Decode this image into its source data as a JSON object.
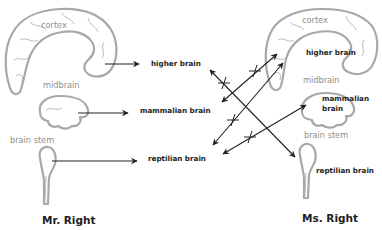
{
  "diagram": {
    "left": {
      "title": "Mr. Right",
      "parts": {
        "cortex": "cortex",
        "midbrain": "midbrain",
        "brain_stem": "brain stem"
      },
      "targets": {
        "higher": "higher brain",
        "mammalian": "mammalian brain",
        "reptilian": "reptilian brain"
      }
    },
    "right": {
      "title": "Ms. Right",
      "parts": {
        "cortex": "cortex",
        "midbrain": "midbrain",
        "brain_stem": "brain stem"
      },
      "labels": {
        "higher": "higher brain",
        "mammalian_line1": "mammalian",
        "mammalian_line2": "brain",
        "reptilian": "reptilian brain"
      }
    },
    "connections": [
      {
        "from": "Mr. Right higher brain",
        "to": "Ms. Right reptilian brain",
        "crossed_out": true
      },
      {
        "from": "Mr. Right mammalian brain",
        "to": "Ms. Right higher brain",
        "crossed_out": true
      },
      {
        "from": "Mr. Right reptilian brain",
        "to": "Ms. Right higher brain",
        "crossed_out": true
      },
      {
        "from": "Mr. Right reptilian brain",
        "to": "Ms. Right mammalian brain",
        "crossed_out": true
      }
    ],
    "colors": {
      "brain_outline": "#a8a8a8",
      "part_label": "#8e8e8e",
      "bold_text": "#1e1e1e",
      "arrow": "#222222"
    }
  }
}
